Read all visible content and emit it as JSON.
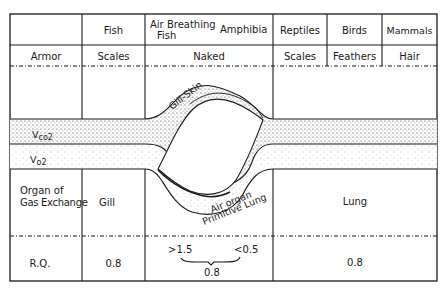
{
  "table": {
    "header": {
      "columns": [
        {
          "label": ""
        },
        {
          "label": "Fish"
        },
        {
          "label_line1": "Air Breathing",
          "label_line2": "Fish",
          "label_extra": "Amphibia"
        },
        {
          "label": "Reptiles"
        },
        {
          "label": "Birds"
        },
        {
          "label": "Mammals"
        }
      ]
    },
    "armor_row": {
      "label": "Armor",
      "fish": "Scales",
      "air_breathing_amphibia": "Naked",
      "reptiles": "Scales",
      "birds": "Feathers",
      "mammals": "Hair"
    },
    "flow_band": {
      "vco2_label": "V",
      "vco2_sub": "co2",
      "vo2_label": "V",
      "vo2_sub": "o2",
      "gill_skin_label": "Gill-Skin",
      "air_organ_label_line1": "Air organ",
      "air_organ_label_line2": "Primitive Lung"
    },
    "organ_row": {
      "label_line1": "Organ of",
      "label_line2": "Gas Exchange",
      "fish": "Gill",
      "lung_cols": "Lung"
    },
    "rq_row": {
      "label": "R.Q.",
      "fish": "0.8",
      "transition_high": ">1.5",
      "transition_low": "<0.5",
      "transition_mean": "0.8",
      "lung_cols": "0.8"
    }
  }
}
